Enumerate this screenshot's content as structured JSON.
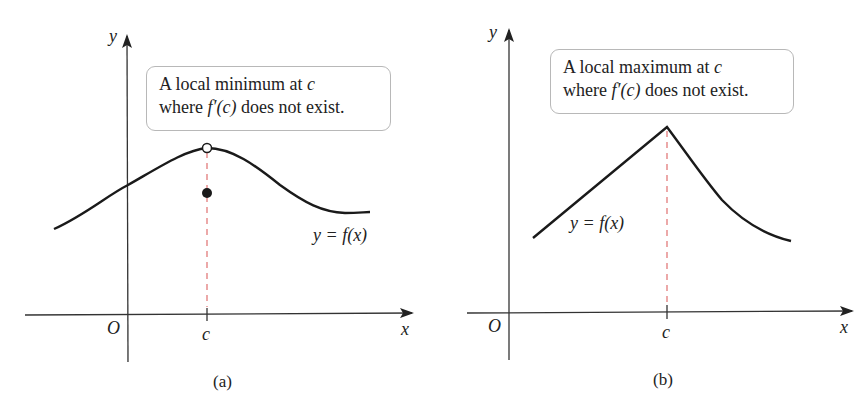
{
  "panels": [
    {
      "id": "a",
      "caption": "(a)",
      "callout": {
        "line1_prefix": "A local minimum at ",
        "line1_var": "c",
        "line2_prefix": "where ",
        "line2_math": "f′(c)",
        "line2_suffix": " does not exist."
      },
      "axis": {
        "y_label": "y",
        "x_label": "x",
        "origin_label": "O",
        "tick_label": "c"
      },
      "curve_label": "y = f(x)",
      "markers": {
        "open_circle": "hole at top of curve above c",
        "filled_dot": "f(c) value below curve"
      }
    },
    {
      "id": "b",
      "caption": "(b)",
      "callout": {
        "line1_prefix": "A local maximum at ",
        "line1_var": "c",
        "line2_prefix": "where ",
        "line2_math": "f′(c)",
        "line2_suffix": " does not exist."
      },
      "axis": {
        "y_label": "y",
        "x_label": "x",
        "origin_label": "O",
        "tick_label": "c"
      },
      "curve_label": "y = f(x)"
    }
  ],
  "colors": {
    "curve": "#1a1a1a",
    "axis": "#333333",
    "dashed": "#e07070",
    "box_border": "#b8b8b8"
  }
}
